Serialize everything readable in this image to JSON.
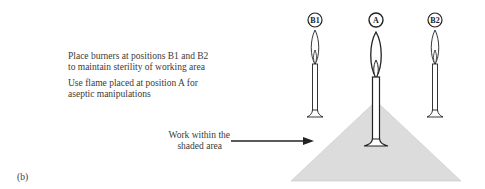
{
  "instructions": {
    "line1": "Place burners at positions B1 and B2",
    "line2": "to maintain sterility of working area",
    "line3": "Use flame placed at position A for",
    "line4": "aseptic manipulations"
  },
  "pointer": {
    "line1": "Work within the",
    "line2": "shaded area"
  },
  "panel_label": "(b)",
  "burners": [
    {
      "label": "B1",
      "role": "side-burner"
    },
    {
      "label": "A",
      "role": "working-flame"
    },
    {
      "label": "B2",
      "role": "side-burner"
    }
  ],
  "colors": {
    "shaded_area": "#dcdcdc",
    "lines": "#222222"
  }
}
